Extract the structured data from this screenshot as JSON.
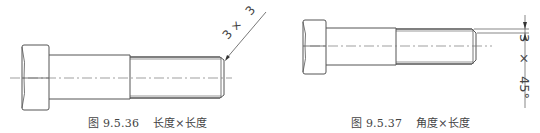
{
  "figures": [
    {
      "id": "fig-9-5-36",
      "caption_number": "图 9.5.36",
      "caption_text": "长度×长度",
      "dimension": {
        "first": "3",
        "separator": "×",
        "second": "3",
        "style": "leader-line"
      }
    },
    {
      "id": "fig-9-5-37",
      "caption_number": "图 9.5.37",
      "caption_text": "角度×长度",
      "dimension": {
        "angle": "45°",
        "separator": "×",
        "length": "3",
        "full": "45°×3",
        "style": "vertical-dimension"
      }
    }
  ],
  "colors": {
    "line": "#555555",
    "centerline": "#777777",
    "text": "#444444",
    "background": "#ffffff"
  }
}
